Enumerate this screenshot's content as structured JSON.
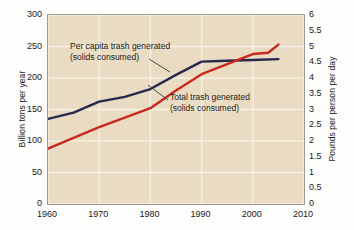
{
  "chart_data": {
    "type": "line",
    "title": "",
    "xlabel": "",
    "ylabel": "Billion tons per year",
    "ylabel_right": "Pounds per person per day",
    "xlim": [
      1960,
      2010
    ],
    "ylim": [
      0,
      300
    ],
    "ylim_right": [
      0,
      6
    ],
    "grid": true,
    "legend_position": "inline-annotations",
    "background_color": "#e9dcc3",
    "x_ticks": [
      "1960",
      "1970",
      "1980",
      "1990",
      "2000",
      "2010"
    ],
    "x_tick_values": [
      1960,
      1970,
      1980,
      1990,
      2000,
      2010
    ],
    "y_ticks_left": [
      "0",
      "50",
      "100",
      "150",
      "200",
      "250",
      "300"
    ],
    "y_tick_values_left": [
      0,
      50,
      100,
      150,
      200,
      250,
      300
    ],
    "y_ticks_right": [
      "0",
      "0.5",
      "1",
      "1.5",
      "2",
      "2.5",
      "3",
      "3.5",
      "4",
      "4.5",
      "5",
      "5.5",
      "6"
    ],
    "y_tick_values_right": [
      0,
      0.5,
      1,
      1.5,
      2,
      2.5,
      3,
      3.5,
      4,
      4.5,
      5,
      5.5,
      6
    ],
    "series": [
      {
        "name": "Per capita trash generated (solids consumed)",
        "color": "#28284f",
        "axis": "right",
        "unit": "pounds per person per day",
        "x": [
          1960,
          1965,
          1970,
          1975,
          1980,
          1985,
          1990,
          1995,
          2000,
          2005
        ],
        "values": [
          2.7,
          2.9,
          3.25,
          3.4,
          3.65,
          4.1,
          4.52,
          4.55,
          4.57,
          4.6
        ],
        "values_left_scale": [
          137,
          147,
          164,
          172,
          185,
          207,
          227,
          229,
          229,
          230
        ]
      },
      {
        "name": "Total trash generated (solids consumed)",
        "color": "#c8281e",
        "axis": "left",
        "unit": "billion tons per year",
        "x": [
          1960,
          1965,
          1970,
          1975,
          1980,
          1985,
          1990,
          1995,
          2000,
          2003,
          2005
        ],
        "values": [
          88,
          105,
          122,
          137,
          152,
          180,
          206,
          222,
          238,
          240,
          253
        ],
        "values_right_scale": [
          1.76,
          2.1,
          2.44,
          2.74,
          3.04,
          3.6,
          4.12,
          4.44,
          4.76,
          4.8,
          5.06
        ]
      }
    ],
    "annotations": [
      {
        "name": "per-capita-annotation",
        "line1": "Per capita trash generated",
        "line2": "(solids consumed)",
        "target_series": "Per capita trash generated (solids consumed)"
      },
      {
        "name": "total-trash-annotation",
        "line1": "Total trash generated",
        "line2": "(solids consumed)",
        "target_series": "Total trash generated (solids consumed)"
      }
    ]
  },
  "axes": {
    "left_title": "Billion tons per year",
    "right_title": "Pounds per person per day"
  },
  "ticks": {
    "left": [
      "300",
      "250",
      "200",
      "150",
      "100",
      "50",
      "0"
    ],
    "right": [
      "6",
      "5.5",
      "5",
      "4.5",
      "4",
      "3.5",
      "3",
      "2.5",
      "2",
      "1.5",
      "1",
      "0.5",
      "0"
    ],
    "x": [
      "1960",
      "1970",
      "1980",
      "1990",
      "2000",
      "2010"
    ]
  },
  "annotations": {
    "navy_line1": "Per capita trash generated",
    "navy_line2": "(solids consumed)",
    "red_line1": "Total trash generated",
    "red_line2": "(solids consumed)"
  },
  "colors": {
    "navy": "#28284f",
    "red": "#c8281e",
    "plot_background": "#e9dcc3",
    "gridline": "#f6efe2",
    "axis_border": "#9b9b93"
  }
}
